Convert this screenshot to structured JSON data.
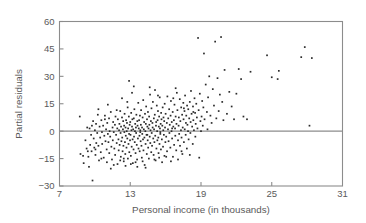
{
  "chart_data": {
    "type": "scatter",
    "title": "",
    "xlabel": "Personal income (in thousands)",
    "ylabel": "Partial residuals",
    "xlim": [
      7,
      31
    ],
    "ylim": [
      -30,
      60
    ],
    "xticks": [
      7,
      13,
      19,
      25,
      31
    ],
    "yticks": [
      -30,
      -15,
      0,
      15,
      30,
      45,
      60
    ],
    "xtick_labels": [
      "7",
      "13",
      "19",
      "25",
      "31"
    ],
    "ytick_labels": [
      "-30",
      "-15",
      "0",
      "15",
      "30",
      "45",
      "60"
    ],
    "grid": false,
    "legend": null,
    "annotations": [
      {
        "type": "hline",
        "y": 0,
        "color": "#8c8c8c",
        "label": "zero reference line"
      }
    ],
    "marker": {
      "shape": "square",
      "size": 1.7,
      "color": "#2b2b2b"
    },
    "n_points": 404,
    "points": [
      [
        8.72,
        8.0
      ],
      [
        8.78,
        -12.5
      ],
      [
        9.0,
        -13.5
      ],
      [
        9.05,
        -17.5
      ],
      [
        9.2,
        -5.0
      ],
      [
        9.3,
        -9.5
      ],
      [
        9.35,
        2.0
      ],
      [
        9.45,
        -14.0
      ],
      [
        9.5,
        -19.5
      ],
      [
        9.55,
        1.5
      ],
      [
        9.6,
        -7.5
      ],
      [
        9.68,
        -2.0
      ],
      [
        9.72,
        -11.0
      ],
      [
        9.8,
        -27.0
      ],
      [
        9.85,
        5.5
      ],
      [
        9.9,
        -4.0
      ],
      [
        9.95,
        -9.0
      ],
      [
        10.0,
        0.5
      ],
      [
        10.05,
        -13.0
      ],
      [
        10.1,
        4.0
      ],
      [
        10.12,
        -6.5
      ],
      [
        10.2,
        -1.0
      ],
      [
        10.25,
        9.0
      ],
      [
        10.3,
        -8.0
      ],
      [
        10.35,
        -16.0
      ],
      [
        10.4,
        2.5
      ],
      [
        10.45,
        -3.5
      ],
      [
        10.5,
        -11.5
      ],
      [
        10.55,
        6.0
      ],
      [
        10.6,
        -0.5
      ],
      [
        10.62,
        -7.0
      ],
      [
        10.7,
        3.0
      ],
      [
        10.75,
        -14.5
      ],
      [
        10.8,
        -2.5
      ],
      [
        10.85,
        8.5
      ],
      [
        10.9,
        -5.5
      ],
      [
        10.95,
        1.0
      ],
      [
        11.0,
        -10.0
      ],
      [
        11.02,
        -17.0
      ],
      [
        11.05,
        4.5
      ],
      [
        11.1,
        -1.5
      ],
      [
        11.15,
        -6.0
      ],
      [
        11.2,
        7.0
      ],
      [
        11.22,
        -12.0
      ],
      [
        11.25,
        0.0
      ],
      [
        11.3,
        -3.0
      ],
      [
        11.35,
        10.5
      ],
      [
        11.4,
        -8.5
      ],
      [
        11.45,
        -15.5
      ],
      [
        11.5,
        2.0
      ],
      [
        11.52,
        -5.0
      ],
      [
        11.55,
        5.0
      ],
      [
        11.6,
        -0.5
      ],
      [
        11.65,
        -9.5
      ],
      [
        11.7,
        3.5
      ],
      [
        11.72,
        -13.0
      ],
      [
        11.75,
        8.0
      ],
      [
        11.8,
        -2.0
      ],
      [
        11.85,
        -6.5
      ],
      [
        11.9,
        1.5
      ],
      [
        11.92,
        -18.0
      ],
      [
        11.95,
        6.5
      ],
      [
        12.0,
        -4.5
      ],
      [
        12.02,
        -10.5
      ],
      [
        12.05,
        0.5
      ],
      [
        12.08,
        4.0
      ],
      [
        12.1,
        -7.5
      ],
      [
        12.15,
        11.0
      ],
      [
        12.18,
        -1.0
      ],
      [
        12.2,
        -14.0
      ],
      [
        12.22,
        2.5
      ],
      [
        12.25,
        -5.5
      ],
      [
        12.3,
        7.5
      ],
      [
        12.32,
        -3.5
      ],
      [
        12.35,
        -11.0
      ],
      [
        12.38,
        1.0
      ],
      [
        12.4,
        5.5
      ],
      [
        12.42,
        -8.0
      ],
      [
        12.45,
        -16.5
      ],
      [
        12.48,
        3.0
      ],
      [
        12.5,
        -0.5
      ],
      [
        12.52,
        9.5
      ],
      [
        12.55,
        -6.0
      ],
      [
        12.58,
        -12.5
      ],
      [
        12.6,
        2.0
      ],
      [
        12.62,
        -2.5
      ],
      [
        12.65,
        6.0
      ],
      [
        12.68,
        -9.0
      ],
      [
        12.7,
        0.0
      ],
      [
        12.72,
        4.5
      ],
      [
        12.75,
        -4.0
      ],
      [
        12.78,
        13.0
      ],
      [
        12.8,
        -15.0
      ],
      [
        12.82,
        1.5
      ],
      [
        12.85,
        -7.0
      ],
      [
        12.88,
        8.0
      ],
      [
        12.9,
        -1.5
      ],
      [
        12.92,
        -11.5
      ],
      [
        12.95,
        3.5
      ],
      [
        12.98,
        -5.0
      ],
      [
        13.0,
        5.0
      ],
      [
        13.02,
        -2.0
      ],
      [
        13.05,
        -13.5
      ],
      [
        13.08,
        10.0
      ],
      [
        13.1,
        0.5
      ],
      [
        13.12,
        -8.5
      ],
      [
        13.15,
        2.5
      ],
      [
        13.18,
        6.5
      ],
      [
        13.2,
        -4.5
      ],
      [
        13.22,
        -17.5
      ],
      [
        13.25,
        1.0
      ],
      [
        13.28,
        -10.0
      ],
      [
        13.3,
        7.0
      ],
      [
        13.32,
        -3.0
      ],
      [
        13.35,
        12.0
      ],
      [
        13.38,
        -6.0
      ],
      [
        13.4,
        0.0
      ],
      [
        13.42,
        4.0
      ],
      [
        13.45,
        -12.0
      ],
      [
        13.48,
        2.0
      ],
      [
        13.5,
        -1.0
      ],
      [
        13.52,
        9.0
      ],
      [
        13.55,
        -7.5
      ],
      [
        13.58,
        -15.5
      ],
      [
        13.6,
        5.5
      ],
      [
        13.62,
        3.0
      ],
      [
        13.65,
        -4.0
      ],
      [
        13.68,
        15.5
      ],
      [
        13.7,
        -9.5
      ],
      [
        13.72,
        1.5
      ],
      [
        13.75,
        6.0
      ],
      [
        13.78,
        -2.5
      ],
      [
        13.8,
        -11.0
      ],
      [
        13.82,
        8.5
      ],
      [
        13.85,
        0.5
      ],
      [
        13.88,
        -5.5
      ],
      [
        13.9,
        3.5
      ],
      [
        13.92,
        11.5
      ],
      [
        13.95,
        -8.0
      ],
      [
        13.98,
        -14.5
      ],
      [
        14.0,
        2.0
      ],
      [
        14.02,
        -1.5
      ],
      [
        14.05,
        7.5
      ],
      [
        14.08,
        -4.5
      ],
      [
        14.1,
        17.0
      ],
      [
        14.12,
        -10.5
      ],
      [
        14.15,
        1.0
      ],
      [
        14.18,
        5.0
      ],
      [
        14.2,
        -3.5
      ],
      [
        14.22,
        -18.5
      ],
      [
        14.25,
        9.5
      ],
      [
        14.28,
        0.0
      ],
      [
        14.3,
        -7.0
      ],
      [
        14.32,
        4.0
      ],
      [
        14.35,
        13.5
      ],
      [
        14.38,
        -2.0
      ],
      [
        14.4,
        -12.5
      ],
      [
        14.42,
        6.5
      ],
      [
        14.45,
        2.5
      ],
      [
        14.48,
        -5.0
      ],
      [
        14.5,
        10.5
      ],
      [
        14.52,
        -9.0
      ],
      [
        14.55,
        1.5
      ],
      [
        14.58,
        -15.0
      ],
      [
        14.6,
        8.0
      ],
      [
        14.62,
        3.5
      ],
      [
        14.65,
        -3.0
      ],
      [
        14.68,
        20.0
      ],
      [
        14.7,
        -6.5
      ],
      [
        14.72,
        0.5
      ],
      [
        14.75,
        5.5
      ],
      [
        14.78,
        -11.5
      ],
      [
        14.8,
        12.5
      ],
      [
        14.82,
        -1.0
      ],
      [
        14.85,
        -8.0
      ],
      [
        14.88,
        4.5
      ],
      [
        14.9,
        2.0
      ],
      [
        14.92,
        16.0
      ],
      [
        14.95,
        -4.0
      ],
      [
        14.98,
        -13.0
      ],
      [
        15.0,
        7.0
      ],
      [
        15.02,
        1.0
      ],
      [
        15.05,
        -6.0
      ],
      [
        15.08,
        9.0
      ],
      [
        15.1,
        22.5
      ],
      [
        15.12,
        -2.5
      ],
      [
        15.15,
        -16.0
      ],
      [
        15.18,
        3.0
      ],
      [
        15.2,
        5.0
      ],
      [
        15.22,
        -9.5
      ],
      [
        15.25,
        14.0
      ],
      [
        15.28,
        0.0
      ],
      [
        15.3,
        -5.0
      ],
      [
        15.32,
        6.0
      ],
      [
        15.35,
        11.0
      ],
      [
        15.38,
        -3.5
      ],
      [
        15.4,
        -12.0
      ],
      [
        15.42,
        2.5
      ],
      [
        15.45,
        8.0
      ],
      [
        15.48,
        -7.0
      ],
      [
        15.5,
        18.5
      ],
      [
        15.52,
        1.5
      ],
      [
        15.55,
        -1.5
      ],
      [
        15.58,
        4.0
      ],
      [
        15.6,
        -10.0
      ],
      [
        15.62,
        10.0
      ],
      [
        15.65,
        6.5
      ],
      [
        15.68,
        -4.5
      ],
      [
        15.7,
        -17.0
      ],
      [
        15.72,
        3.0
      ],
      [
        15.75,
        13.0
      ],
      [
        15.78,
        -8.5
      ],
      [
        15.8,
        0.5
      ],
      [
        15.82,
        7.5
      ],
      [
        15.85,
        -2.0
      ],
      [
        15.88,
        5.5
      ],
      [
        15.9,
        -13.5
      ],
      [
        15.92,
        15.0
      ],
      [
        15.95,
        2.0
      ],
      [
        15.98,
        -6.0
      ],
      [
        16.0,
        9.5
      ],
      [
        16.05,
        -3.0
      ],
      [
        16.1,
        4.5
      ],
      [
        16.12,
        -11.0
      ],
      [
        16.15,
        19.0
      ],
      [
        16.2,
        1.0
      ],
      [
        16.22,
        7.0
      ],
      [
        16.25,
        -5.5
      ],
      [
        16.3,
        12.0
      ],
      [
        16.32,
        -1.0
      ],
      [
        16.35,
        3.5
      ],
      [
        16.4,
        -9.0
      ],
      [
        16.42,
        8.5
      ],
      [
        16.45,
        16.5
      ],
      [
        16.5,
        0.0
      ],
      [
        16.52,
        5.0
      ],
      [
        16.55,
        -4.0
      ],
      [
        16.6,
        10.5
      ],
      [
        16.62,
        -14.0
      ],
      [
        16.65,
        2.5
      ],
      [
        16.7,
        6.0
      ],
      [
        16.72,
        -7.5
      ],
      [
        16.75,
        14.5
      ],
      [
        16.8,
        1.5
      ],
      [
        16.82,
        -2.5
      ],
      [
        16.85,
        8.0
      ],
      [
        16.9,
        -10.5
      ],
      [
        16.92,
        4.0
      ],
      [
        16.95,
        21.0
      ],
      [
        17.0,
        11.5
      ],
      [
        17.05,
        -5.0
      ],
      [
        17.1,
        3.0
      ],
      [
        17.12,
        7.5
      ],
      [
        17.15,
        -1.5
      ],
      [
        17.2,
        17.5
      ],
      [
        17.22,
        -8.0
      ],
      [
        17.25,
        5.5
      ],
      [
        17.3,
        0.5
      ],
      [
        17.32,
        13.0
      ],
      [
        17.35,
        -3.5
      ],
      [
        17.4,
        9.0
      ],
      [
        17.42,
        -12.5
      ],
      [
        17.45,
        2.0
      ],
      [
        17.5,
        15.5
      ],
      [
        17.52,
        6.5
      ],
      [
        17.55,
        -6.0
      ],
      [
        17.6,
        11.0
      ],
      [
        17.62,
        1.0
      ],
      [
        17.65,
        19.5
      ],
      [
        17.7,
        -2.0
      ],
      [
        17.72,
        4.5
      ],
      [
        17.75,
        8.5
      ],
      [
        17.8,
        -9.5
      ],
      [
        17.82,
        14.0
      ],
      [
        17.85,
        3.5
      ],
      [
        17.9,
        0.0
      ],
      [
        17.92,
        12.0
      ],
      [
        17.95,
        -4.5
      ],
      [
        18.0,
        7.0
      ],
      [
        18.05,
        16.0
      ],
      [
        18.1,
        -1.0
      ],
      [
        18.12,
        5.0
      ],
      [
        18.15,
        22.0
      ],
      [
        18.2,
        9.5
      ],
      [
        18.25,
        2.5
      ],
      [
        18.3,
        -7.0
      ],
      [
        18.32,
        13.5
      ],
      [
        18.35,
        6.0
      ],
      [
        18.4,
        0.5
      ],
      [
        18.45,
        18.0
      ],
      [
        18.5,
        10.0
      ],
      [
        18.52,
        -3.0
      ],
      [
        18.55,
        4.0
      ],
      [
        18.6,
        15.0
      ],
      [
        18.65,
        7.5
      ],
      [
        18.7,
        1.5
      ],
      [
        18.75,
        51.0
      ],
      [
        18.8,
        11.5
      ],
      [
        18.85,
        -14.5
      ],
      [
        18.9,
        20.5
      ],
      [
        18.95,
        5.5
      ],
      [
        19.0,
        0.0
      ],
      [
        19.05,
        8.0
      ],
      [
        19.1,
        16.5
      ],
      [
        19.15,
        3.0
      ],
      [
        19.2,
        13.0
      ],
      [
        19.25,
        42.5
      ],
      [
        19.3,
        6.5
      ],
      [
        19.4,
        25.5
      ],
      [
        19.5,
        10.5
      ],
      [
        19.55,
        1.0
      ],
      [
        19.6,
        18.5
      ],
      [
        19.7,
        30.0
      ],
      [
        19.8,
        8.5
      ],
      [
        19.9,
        4.5
      ],
      [
        20.0,
        23.0
      ],
      [
        20.1,
        14.0
      ],
      [
        20.2,
        49.0
      ],
      [
        20.3,
        7.0
      ],
      [
        20.4,
        29.0
      ],
      [
        20.5,
        11.0
      ],
      [
        20.6,
        20.0
      ],
      [
        20.7,
        51.5
      ],
      [
        20.8,
        16.0
      ],
      [
        20.9,
        6.0
      ],
      [
        21.0,
        33.5
      ],
      [
        21.2,
        9.5
      ],
      [
        21.4,
        21.5
      ],
      [
        21.6,
        13.5
      ],
      [
        21.8,
        6.5
      ],
      [
        22.0,
        20.5
      ],
      [
        22.2,
        34.0
      ],
      [
        22.4,
        28.5
      ],
      [
        22.6,
        8.0
      ],
      [
        22.9,
        6.5
      ],
      [
        23.2,
        32.5
      ],
      [
        24.6,
        41.5
      ],
      [
        25.0,
        29.5
      ],
      [
        25.5,
        28.5
      ],
      [
        25.6,
        33.0
      ],
      [
        27.5,
        40.5
      ],
      [
        27.8,
        46.0
      ],
      [
        28.2,
        3.0
      ],
      [
        28.4,
        40.0
      ],
      [
        10.3,
        12.0
      ],
      [
        11.1,
        14.5
      ],
      [
        12.3,
        18.0
      ],
      [
        12.9,
        27.5
      ],
      [
        13.3,
        24.5
      ],
      [
        13.6,
        -19.5
      ],
      [
        14.3,
        -20.0
      ],
      [
        12.6,
        -19.0
      ],
      [
        11.35,
        -20.5
      ],
      [
        11.6,
        -18.5
      ],
      [
        10.55,
        -15.0
      ],
      [
        12.15,
        -16.0
      ],
      [
        13.05,
        -18.0
      ],
      [
        14.05,
        -16.5
      ],
      [
        15.05,
        -15.5
      ],
      [
        16.05,
        -14.0
      ],
      [
        17.05,
        -15.5
      ],
      [
        15.45,
        -14.5
      ],
      [
        13.45,
        -17.0
      ],
      [
        12.45,
        -15.0
      ],
      [
        9.4,
        -11.0
      ],
      [
        10.05,
        -10.0
      ],
      [
        16.45,
        -16.5
      ],
      [
        17.35,
        -11.0
      ],
      [
        18.05,
        -13.0
      ],
      [
        14.65,
        24.0
      ],
      [
        15.35,
        19.5
      ],
      [
        16.65,
        18.0
      ],
      [
        12.75,
        16.0
      ],
      [
        13.15,
        21.0
      ],
      [
        11.85,
        11.5
      ],
      [
        10.85,
        6.5
      ],
      [
        9.75,
        3.0
      ],
      [
        16.85,
        23.5
      ],
      [
        17.55,
        12.5
      ],
      [
        18.35,
        10.5
      ],
      [
        14.45,
        -2.0
      ],
      [
        15.55,
        -0.5
      ],
      [
        16.55,
        1.5
      ],
      [
        13.85,
        -0.5
      ]
    ]
  },
  "axes": {
    "x_title": "Personal income (in thousands)",
    "y_title": "Partial residuals"
  },
  "colors": {
    "frame": "#8c8c8c",
    "point": "#2b2b2b",
    "zeroline": "#8c8c8c",
    "text": "#5a5a5a",
    "background": "#ffffff"
  }
}
